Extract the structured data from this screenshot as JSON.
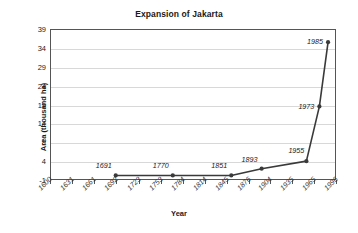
{
  "chart_data": {
    "type": "line",
    "title": "Expansion of Jakarta",
    "xlabel": "Year",
    "ylabel": "Area (thousand ha)",
    "x": [
      1691,
      1770,
      1851,
      1893,
      1955,
      1973,
      1985
    ],
    "values": [
      0.2,
      0.2,
      0.2,
      2.0,
      4.0,
      18.5,
      35.5
    ],
    "point_labels": [
      "1691",
      "1770",
      "1851",
      "1893",
      "1955",
      "1973",
      "1985"
    ],
    "xlim": [
      1600,
      1996
    ],
    "ylim": [
      -1,
      39
    ],
    "yticks": [
      -1,
      4,
      9,
      14,
      19,
      24,
      29,
      34,
      39
    ],
    "ytick_labels": [
      "-1",
      "4",
      "9",
      "14",
      "19",
      "24",
      "29",
      "34",
      "39"
    ],
    "xticks": [
      1600,
      1631,
      1661,
      1692,
      1723,
      1753,
      1784,
      1814,
      1845,
      1876,
      1904,
      1935,
      1965,
      1996
    ],
    "xtick_labels": [
      "1600",
      "1631",
      "1661",
      "1692",
      "1723",
      "1753",
      "1784",
      "1814",
      "1845",
      "1876",
      "1904",
      "1935",
      "1965",
      "1996"
    ],
    "grid": true,
    "legend": "none",
    "series_color": "#3a3a3a",
    "grid_color": "#d8d8d8",
    "axis_color": "#555555",
    "background": "#ffffff"
  }
}
